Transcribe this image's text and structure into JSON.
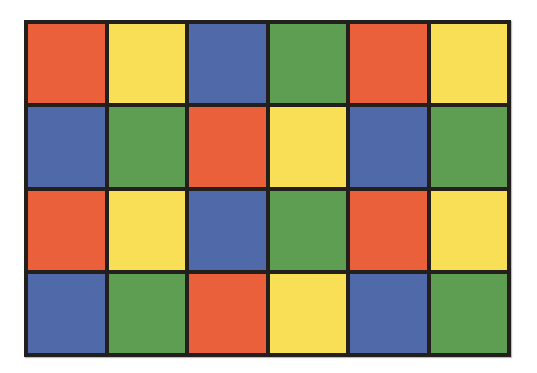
{
  "palette": {
    "red": "#E9603B",
    "yellow": "#F9DF55",
    "blue": "#5069A8",
    "green": "#5E9E52",
    "border": "#231F1C",
    "background": "#FFFFFF"
  },
  "grid": {
    "columns": 6,
    "rows": 4,
    "cells": [
      [
        "red",
        "yellow",
        "blue",
        "green",
        "red",
        "yellow"
      ],
      [
        "blue",
        "green",
        "red",
        "yellow",
        "blue",
        "green"
      ],
      [
        "red",
        "yellow",
        "blue",
        "green",
        "red",
        "yellow"
      ],
      [
        "blue",
        "green",
        "red",
        "yellow",
        "blue",
        "green"
      ]
    ]
  }
}
